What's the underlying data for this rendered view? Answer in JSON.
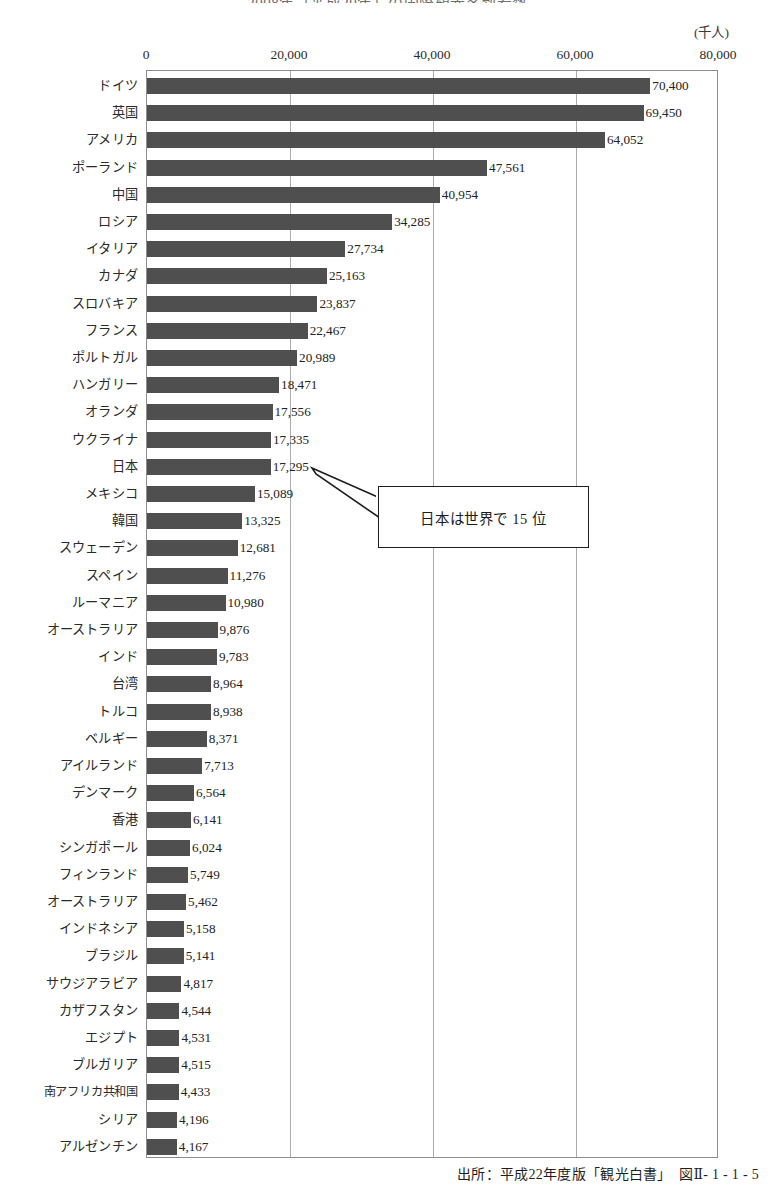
{
  "chart_data": {
    "type": "bar",
    "orientation": "horizontal",
    "title": "2008年（平成20年）の国際観光客到着数",
    "unit_label": "(千人)",
    "xlabel": "",
    "ylabel": "",
    "xlim": [
      0,
      80000
    ],
    "xticks": [
      "0",
      "20,000",
      "40,000",
      "60,000",
      "80,000"
    ],
    "xtick_values": [
      0,
      20000,
      40000,
      60000,
      80000
    ],
    "grid": true,
    "legend": false,
    "series_name": "国際観光客到着数",
    "bar_color": "#4f4f4f",
    "categories": [
      "ドイツ",
      "英国",
      "アメリカ",
      "ポーランド",
      "中国",
      "ロシア",
      "イタリア",
      "カナダ",
      "スロバキア",
      "フランス",
      "ポルトガル",
      "ハンガリー",
      "オランダ",
      "ウクライナ",
      "日本",
      "メキシコ",
      "韓国",
      "スウェーデン",
      "スペイン",
      "ルーマニア",
      "オーストラリア",
      "インド",
      "台湾",
      "トルコ",
      "ベルギー",
      "アイルランド",
      "デンマーク",
      "香港",
      "シンガポール",
      "フィンランド",
      "オーストラリア",
      "インドネシア",
      "ブラジル",
      "サウジアラビア",
      "カザフスタン",
      "エジプト",
      "ブルガリア",
      "南アフリカ共和国",
      "シリア",
      "アルゼンチン"
    ],
    "values": [
      70400,
      69450,
      64052,
      47561,
      40954,
      34285,
      27734,
      25163,
      23837,
      22467,
      20989,
      18471,
      17556,
      17335,
      17295,
      15089,
      13325,
      12681,
      11276,
      10980,
      9876,
      9783,
      8964,
      8938,
      8371,
      7713,
      6564,
      6141,
      6024,
      5749,
      5462,
      5158,
      5141,
      4817,
      4544,
      4531,
      4515,
      4433,
      4196,
      4167
    ],
    "value_labels": [
      "70,400",
      "69,450",
      "64,052",
      "47,561",
      "40,954",
      "34,285",
      "27,734",
      "25,163",
      "23,837",
      "22,467",
      "20,989",
      "18,471",
      "17,556",
      "17,335",
      "17,295",
      "15,089",
      "13,325",
      "12,681",
      "11,276",
      "10,980",
      "9,876",
      "9,783",
      "8,964",
      "8,938",
      "8,371",
      "7,713",
      "6,564",
      "6,141",
      "6,024",
      "5,749",
      "5,462",
      "5,158",
      "5,141",
      "4,817",
      "4,544",
      "4,531",
      "4,515",
      "4,433",
      "4,196",
      "4,167"
    ],
    "annotations": [
      {
        "text": "日本は世界で 15 位",
        "points_to_category": "日本",
        "points_to_value": 17295
      }
    ]
  },
  "annotation": {
    "callout_text": "日本は世界で 15 位"
  },
  "footer": {
    "source": "出所：平成22年度版「観光白書」　図Ⅱ- 1 - 1 - 5"
  }
}
